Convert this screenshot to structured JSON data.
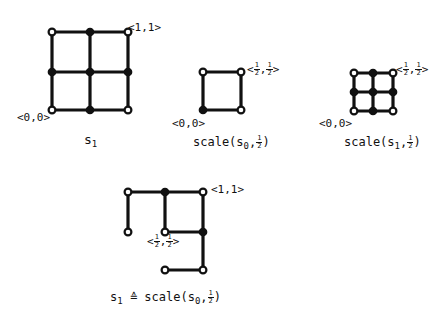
{
  "diagrams": [
    {
      "id": "s1",
      "caption": {
        "main": "s",
        "sub": "1"
      },
      "corner_labels": {
        "origin": "<0,0>",
        "top_right": "<1,1>"
      },
      "nodes": [
        {
          "x": 52,
          "y": 32,
          "type": "open"
        },
        {
          "x": 90,
          "y": 32,
          "type": "filled"
        },
        {
          "x": 128,
          "y": 32,
          "type": "open"
        },
        {
          "x": 52,
          "y": 72,
          "type": "filled"
        },
        {
          "x": 90,
          "y": 72,
          "type": "filled"
        },
        {
          "x": 128,
          "y": 72,
          "type": "filled"
        },
        {
          "x": 52,
          "y": 110,
          "type": "open"
        },
        {
          "x": 90,
          "y": 110,
          "type": "filled"
        },
        {
          "x": 128,
          "y": 110,
          "type": "open"
        }
      ],
      "edges": [
        [
          52,
          32,
          128,
          32
        ],
        [
          52,
          72,
          128,
          72
        ],
        [
          52,
          110,
          128,
          110
        ],
        [
          52,
          32,
          52,
          110
        ],
        [
          90,
          32,
          90,
          110
        ],
        [
          128,
          32,
          128,
          110
        ]
      ]
    },
    {
      "id": "scale-s0",
      "caption": {
        "prefix": "scale(s",
        "sub": "0",
        "sep": ",",
        "frac_n": "1",
        "frac_d": "2",
        "suffix": ")"
      },
      "corner_labels": {
        "origin": "<0,0>",
        "top_right": {
          "open": "<",
          "n1": "1",
          "d1": "2",
          "comma": ",",
          "n2": "1",
          "d2": "2",
          "close": ">"
        }
      },
      "nodes": [
        {
          "x": 203,
          "y": 72,
          "type": "open"
        },
        {
          "x": 241,
          "y": 72,
          "type": "open"
        },
        {
          "x": 203,
          "y": 110,
          "type": "filled"
        },
        {
          "x": 241,
          "y": 110,
          "type": "open"
        }
      ],
      "edges": [
        [
          203,
          72,
          241,
          72
        ],
        [
          203,
          110,
          241,
          110
        ],
        [
          203,
          72,
          203,
          110
        ],
        [
          241,
          72,
          241,
          110
        ]
      ]
    },
    {
      "id": "scale-s1",
      "caption": {
        "prefix": "scale(s",
        "sub": "1",
        "sep": ",",
        "frac_n": "1",
        "frac_d": "2",
        "suffix": ")"
      },
      "corner_labels": {
        "origin": "<0,0>",
        "top_right": {
          "open": "<",
          "n1": "1",
          "d1": "2",
          "comma": ",",
          "n2": "1",
          "d2": "2",
          "close": ">"
        }
      },
      "nodes": [
        {
          "x": 354,
          "y": 73,
          "type": "open"
        },
        {
          "x": 373,
          "y": 73,
          "type": "filled"
        },
        {
          "x": 393,
          "y": 73,
          "type": "open"
        },
        {
          "x": 354,
          "y": 92,
          "type": "filled"
        },
        {
          "x": 373,
          "y": 92,
          "type": "filled"
        },
        {
          "x": 393,
          "y": 92,
          "type": "filled"
        },
        {
          "x": 354,
          "y": 111,
          "type": "open"
        },
        {
          "x": 373,
          "y": 111,
          "type": "filled"
        },
        {
          "x": 393,
          "y": 111,
          "type": "open"
        }
      ],
      "edges": [
        [
          354,
          73,
          393,
          73
        ],
        [
          354,
          92,
          393,
          92
        ],
        [
          354,
          111,
          393,
          111
        ],
        [
          354,
          73,
          354,
          111
        ],
        [
          373,
          73,
          373,
          111
        ],
        [
          393,
          73,
          393,
          111
        ]
      ]
    },
    {
      "id": "s1-equiv",
      "caption": {
        "lhs": "s",
        "lhs_sub": "1",
        "op": "≙",
        "prefix": "scale(s",
        "sub": "0",
        "sep": ",",
        "frac_n": "1",
        "frac_d": "2",
        "suffix": ")"
      },
      "corner_labels": {
        "top_right": "<1,1>",
        "inner": {
          "open": "<",
          "n1": "1",
          "d1": "2",
          "comma": ",",
          "n2": "1",
          "d2": "2",
          "close": ">"
        }
      },
      "nodes": [
        {
          "x": 128,
          "y": 192,
          "type": "open"
        },
        {
          "x": 165,
          "y": 192,
          "type": "filled"
        },
        {
          "x": 203,
          "y": 192,
          "type": "open"
        },
        {
          "x": 128,
          "y": 232,
          "type": "open"
        },
        {
          "x": 165,
          "y": 232,
          "type": "open"
        },
        {
          "x": 203,
          "y": 232,
          "type": "filled"
        },
        {
          "x": 165,
          "y": 270,
          "type": "open"
        },
        {
          "x": 203,
          "y": 270,
          "type": "open"
        }
      ],
      "edges": [
        [
          128,
          192,
          203,
          192
        ],
        [
          128,
          192,
          128,
          232
        ],
        [
          165,
          192,
          165,
          232
        ],
        [
          165,
          232,
          203,
          232
        ],
        [
          203,
          192,
          203,
          270
        ],
        [
          165,
          270,
          203,
          270
        ]
      ]
    }
  ]
}
